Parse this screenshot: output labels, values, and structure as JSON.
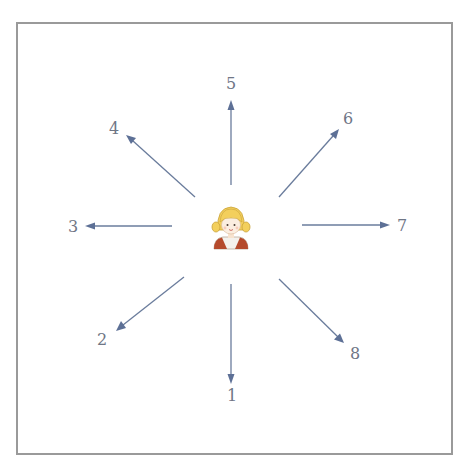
{
  "diagram": {
    "title": "",
    "center": {
      "icon": "girl-character-icon",
      "label": ""
    },
    "directions": [
      {
        "id": 1,
        "label": "1",
        "direction": "down"
      },
      {
        "id": 2,
        "label": "2",
        "direction": "down-left"
      },
      {
        "id": 3,
        "label": "3",
        "direction": "left"
      },
      {
        "id": 4,
        "label": "4",
        "direction": "up-left"
      },
      {
        "id": 5,
        "label": "5",
        "direction": "up"
      },
      {
        "id": 6,
        "label": "6",
        "direction": "up-right"
      },
      {
        "id": 7,
        "label": "7",
        "direction": "right"
      },
      {
        "id": 8,
        "label": "8",
        "direction": "down-right"
      }
    ],
    "colors": {
      "arrow": "#6a7c9c",
      "label": "#6f7686",
      "frame": "#9a9a9a",
      "hair": "#f3cf5c",
      "vest": "#b54a2c"
    }
  }
}
